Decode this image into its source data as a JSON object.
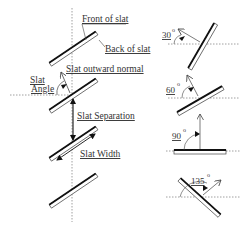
{
  "diagram": {
    "labels": {
      "front_of_slat": "Front of slat",
      "back_of_slat": "Back of slat",
      "slat_outward_normal": "Slat outward normal",
      "slat_angle_line1": "Slat",
      "slat_angle_line2": "Angle",
      "slat_separation": "Slat Separation",
      "slat_width": "Slat Width"
    },
    "angle_examples": [
      {
        "value": "30",
        "unit": "o"
      },
      {
        "value": "60",
        "unit": "o"
      },
      {
        "value": "90",
        "unit": "o"
      },
      {
        "value": "135",
        "unit": "o"
      }
    ],
    "colors": {
      "line": "#111111",
      "guide": "#888888",
      "text": "#333333",
      "background": "#ffffff"
    }
  }
}
